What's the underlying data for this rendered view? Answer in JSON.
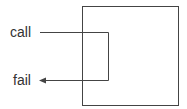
{
  "diagram": {
    "labels": {
      "call": "call",
      "fail": "fail"
    },
    "colors": {
      "stroke": "#444444",
      "text": "#333333",
      "background": "#ffffff"
    }
  }
}
